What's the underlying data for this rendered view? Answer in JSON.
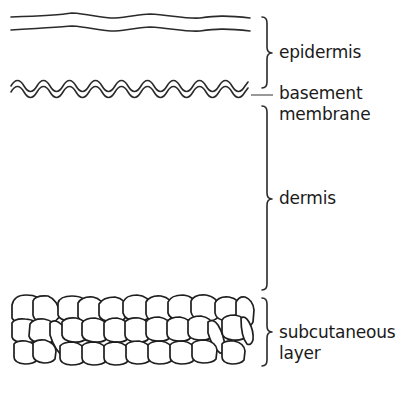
{
  "diagram": {
    "type": "skin-layers-cross-section",
    "colors": {
      "line": "#2a2a2a",
      "text": "#1a1a1a",
      "background": "#ffffff"
    },
    "layers": [
      {
        "id": "epidermis",
        "label": "epidermis",
        "bracket": {
          "top": 17,
          "mid": 53,
          "bottom": 88
        }
      },
      {
        "id": "basement-membrane",
        "label_line1": "basement",
        "label_line2": "membrane",
        "indicator": "leader-line"
      },
      {
        "id": "dermis",
        "label": "dermis",
        "bracket": {
          "top": 106,
          "mid": 199,
          "bottom": 290
        }
      },
      {
        "id": "subcutaneous-layer",
        "label_line1": "subcutaneous",
        "label_line2": "layer",
        "bracket": {
          "top": 298,
          "mid": 332,
          "bottom": 366
        }
      }
    ]
  }
}
